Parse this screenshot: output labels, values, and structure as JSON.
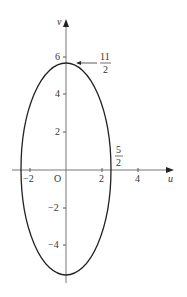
{
  "diagram": {
    "type": "ellipse-plot",
    "axes": {
      "x_label": "u",
      "y_label": "v",
      "origin_label": "O",
      "x_ticks": [
        {
          "value": -2,
          "label": "−2"
        },
        {
          "value": 2,
          "label": "2"
        },
        {
          "value": 4,
          "label": "4"
        }
      ],
      "y_ticks": [
        {
          "value": 6,
          "label": "6"
        },
        {
          "value": 4,
          "label": "4"
        },
        {
          "value": 2,
          "label": "2"
        },
        {
          "value": -2,
          "label": "−2"
        },
        {
          "value": -4,
          "label": "−4"
        }
      ]
    },
    "ellipse": {
      "semi_axis_u": 2.5,
      "semi_axis_v": 5.5,
      "equation": "u^2/(5/2)^2 + v^2/(11/2)^2 = 1"
    },
    "annotations": {
      "top": {
        "numerator": "11",
        "denominator": "2"
      },
      "right": {
        "numerator": "5",
        "denominator": "2"
      }
    },
    "colors": {
      "axis": "#777777",
      "curve": "#222222",
      "text": "#333333"
    }
  }
}
